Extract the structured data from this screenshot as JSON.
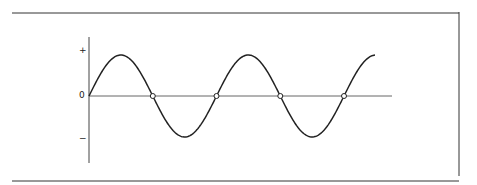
{
  "diagram": {
    "type": "sine-wave",
    "labels": {
      "plus": "+",
      "zero": "0",
      "minus": "−"
    },
    "zero_crossings_marked": 4,
    "colors": {
      "line": "#222222",
      "axis": "#555555",
      "border": "#333333"
    }
  }
}
